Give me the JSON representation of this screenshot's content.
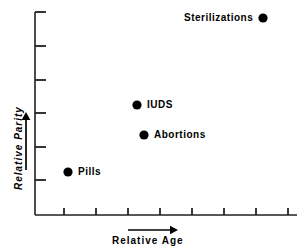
{
  "chart_data": {
    "type": "scatter",
    "title": "",
    "xlabel": "Relative Age",
    "ylabel": "Relative Parity",
    "xlim": [
      0,
      9
    ],
    "ylim": [
      0,
      6.5
    ],
    "grid": false,
    "legend": "none",
    "axis_arrows": {
      "x_direction": "right",
      "y_direction": "up"
    },
    "x_ticks": [
      1,
      2,
      3,
      4,
      5,
      6,
      7,
      8
    ],
    "x_tick_labels": [
      "",
      "",
      "",
      "",
      "",
      "",
      "",
      ""
    ],
    "y_ticks": [
      1,
      2,
      3,
      4,
      5,
      6
    ],
    "y_tick_labels": [
      "",
      "",
      "",
      "",
      "",
      ""
    ],
    "points": [
      {
        "label": "Pills",
        "x": 1.03,
        "y": 1.28,
        "label_side": "right"
      },
      {
        "label": "Abortions",
        "x": 3.4,
        "y": 2.42,
        "label_side": "right"
      },
      {
        "label": "IUDS",
        "x": 3.19,
        "y": 3.34,
        "label_side": "right"
      },
      {
        "label": "Sterilizations",
        "x": 7.13,
        "y": 5.94,
        "label_side": "left"
      }
    ],
    "marker_color": "#000000",
    "axis_color": "#231f20",
    "text_color": "#000000",
    "background_color": "#ffffff"
  },
  "geometry": {
    "axis_x0": 35,
    "axis_y0": 215,
    "axis_top": 12,
    "axis_right": 297,
    "x_tick_positions": [
      64,
      96,
      128,
      160,
      192,
      224,
      256,
      288
    ],
    "y_tick_positions": [
      180,
      147,
      113,
      80,
      46,
      12
    ],
    "tick_len_x": 7,
    "tick_len_y": 11,
    "marker_radius": 4.6,
    "points_px": [
      {
        "cx": 68,
        "cy": 172,
        "lx": 78,
        "ly": 167
      },
      {
        "cx": 144,
        "cy": 135,
        "lx": 154,
        "ly": 130
      },
      {
        "cx": 137,
        "cy": 105,
        "lx": 147,
        "ly": 100
      },
      {
        "cx": 263,
        "cy": 18,
        "lx": 184,
        "ly": 13
      }
    ],
    "x_arrow": {
      "x1": 128,
      "y": 230,
      "x2": 178
    },
    "y_arrow": {
      "x": 26,
      "y1": 170,
      "y2": 112
    },
    "x_title_pos": {
      "x": 112,
      "y": 236
    },
    "y_title_pos": {
      "x": 14,
      "y": 190
    }
  }
}
